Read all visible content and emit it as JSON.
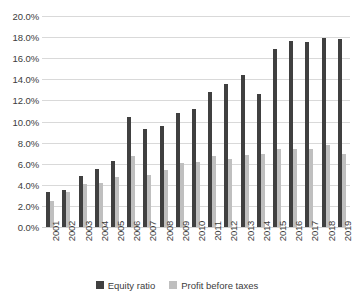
{
  "chart_data": {
    "type": "bar",
    "title": "",
    "subtitle": "",
    "xlabel": "",
    "ylabel": "",
    "ylim": [
      0,
      20
    ],
    "ytick_step": 2,
    "ytick_labels": [
      "0.0%",
      "2.0%",
      "4.0%",
      "6.0%",
      "8.0%",
      "10.0%",
      "12.0%",
      "14.0%",
      "16.0%",
      "18.0%",
      "20.0%"
    ],
    "ytick_values": [
      0,
      2,
      4,
      6,
      8,
      10,
      12,
      14,
      16,
      18,
      20
    ],
    "value_unit": "%",
    "grid": true,
    "grid_axis": "y",
    "legend_position": "bottom-center",
    "categories": [
      "2001",
      "2002",
      "2003",
      "2004",
      "2005",
      "2006",
      "2007",
      "2008",
      "2009",
      "2010",
      "2011",
      "2012",
      "2013",
      "2014",
      "2015",
      "2016",
      "2017",
      "2018",
      "2019"
    ],
    "series": [
      {
        "name": "Equity ratio",
        "color": "#404040",
        "values": [
          3.3,
          3.5,
          4.8,
          5.5,
          6.3,
          10.4,
          9.3,
          9.6,
          10.8,
          11.2,
          12.8,
          13.6,
          14.4,
          12.6,
          16.9,
          17.6,
          17.5,
          17.9,
          17.8
        ]
      },
      {
        "name": "Profit before taxes",
        "color": "#bfbfbf",
        "values": [
          2.5,
          3.3,
          4.1,
          4.2,
          4.7,
          6.7,
          4.9,
          5.4,
          6.1,
          6.2,
          6.7,
          6.4,
          6.8,
          6.9,
          7.4,
          7.4,
          7.4,
          7.8,
          6.9
        ]
      }
    ]
  },
  "legend": {
    "items": [
      {
        "label": "Equity ratio",
        "color": "#404040"
      },
      {
        "label": "Profit before taxes",
        "color": "#bfbfbf"
      }
    ]
  },
  "colors": {
    "equity": "#404040",
    "profit": "#bfbfbf",
    "gridline": "#d9d9d9",
    "text": "#3c3c3c",
    "background": "#ffffff"
  }
}
